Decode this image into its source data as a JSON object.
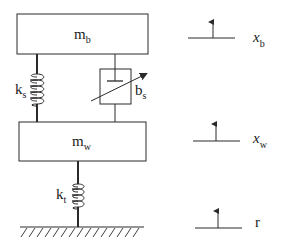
{
  "colors": {
    "stroke": "#2a2a2a",
    "background": "#ffffff"
  },
  "masses": {
    "body": {
      "symbol": "m",
      "subscript": "b"
    },
    "wheel": {
      "symbol": "m",
      "subscript": "w"
    }
  },
  "components": {
    "suspension_spring": {
      "symbol": "k",
      "subscript": "s"
    },
    "suspension_damper": {
      "symbol": "b",
      "subscript": "s",
      "variable": true
    },
    "tire_spring": {
      "symbol": "k",
      "subscript": "t"
    }
  },
  "displacements": [
    {
      "symbol": "x",
      "subscript": "b"
    },
    {
      "symbol": "x",
      "subscript": "w"
    },
    {
      "symbol": "r",
      "subscript": ""
    }
  ],
  "icons": {
    "spring": "coil-spring",
    "damper": "variable-damper",
    "ground": "hatched-ground",
    "arrow": "up-arrow"
  }
}
